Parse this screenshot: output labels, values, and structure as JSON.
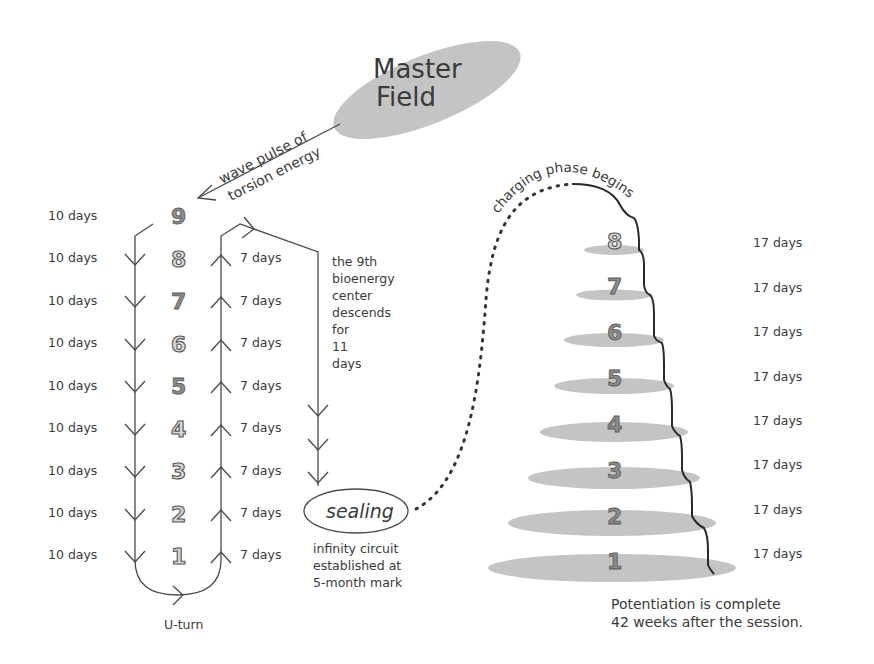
{
  "master_field": {
    "label_line1": "Master",
    "label_line2": "Field",
    "fill": "#c2c2c2"
  },
  "wave_pulse": {
    "line1": "wave pulse of",
    "line2": "torsion energy"
  },
  "descent": {
    "label_top": "9",
    "left_durations": [
      "10 days",
      "10 days",
      "10 days",
      "10 days",
      "10 days",
      "10 days",
      "10 days",
      "10 days",
      "10 days"
    ],
    "centers": [
      "8",
      "7",
      "6",
      "5",
      "4",
      "3",
      "2",
      "1"
    ],
    "ascent_durations": [
      "7 days",
      "7 days",
      "7 days",
      "7 days",
      "7 days",
      "7 days",
      "7 days",
      "7 days"
    ],
    "u_turn": "U-turn"
  },
  "ninth_center": {
    "lines": [
      "the 9th",
      "bioenergy",
      "center",
      "descends",
      "for",
      "11",
      "days"
    ]
  },
  "sealing": {
    "label": "sealing",
    "caption": [
      "infinity circuit",
      "established at",
      "5-month mark"
    ]
  },
  "charging": {
    "title": "charging phase begins",
    "levels": [
      "8",
      "7",
      "6",
      "5",
      "4",
      "3",
      "2",
      "1"
    ],
    "durations": [
      "17 days",
      "17 days",
      "17 days",
      "17 days",
      "17 days",
      "17 days",
      "17 days",
      "17 days"
    ],
    "footer": [
      "Potentiation is complete",
      "42 weeks after the session."
    ]
  }
}
